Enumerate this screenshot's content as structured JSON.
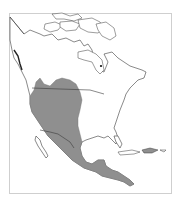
{
  "map": {
    "region": "North America",
    "subject": "species range map",
    "legend": [],
    "colors": {
      "range_fill": "#8f8f8f",
      "land_fill": "#ffffff",
      "coastline": "#3a3a3a",
      "frame": "#cfcfcf",
      "background": "#ffffff"
    },
    "range_description": "Shaded range covering western and central United States from southern Canadian prairies south through Mexico into Central America",
    "marker": {
      "label": "",
      "approx_location": "west of Hudson Bay / Hudson Bay area"
    }
  }
}
